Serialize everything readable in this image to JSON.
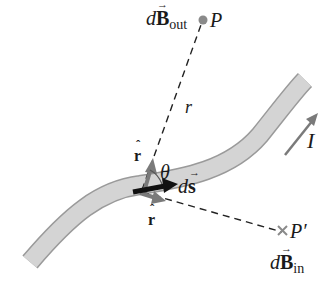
{
  "diagram": {
    "labels": {
      "dB_out_d": "d",
      "dB_out_B": "B",
      "dB_out_sub": "out",
      "dB_out_arrow": "→",
      "point_P": "P",
      "r": "r",
      "r_hat_top": "r",
      "r_hat_top_hat": "ˆ",
      "theta": "θ",
      "ds_d": "d",
      "ds_s": "s",
      "ds_arrow": "→",
      "r_hat_bottom": "r",
      "r_hat_bottom_hat": "ˆ",
      "point_P_prime": "P′",
      "dB_in_d": "d",
      "dB_in_B": "B",
      "dB_in_sub": "in",
      "dB_in_arrow": "→",
      "current": "I"
    },
    "colors": {
      "wire_fill": "#d4d4d4",
      "wire_edge": "#9a9a9a",
      "vector_gray": "#7a7a7a",
      "vector_black": "#111111",
      "point_P": "#8a8a8a",
      "dashed_line": "#222222"
    },
    "markers": {
      "P": "dot",
      "P_prime": "cross"
    }
  }
}
